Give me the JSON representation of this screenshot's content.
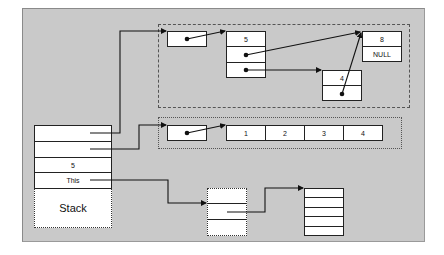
{
  "diagram": {
    "type": "memory-layout",
    "background_color": "#c9c9c9",
    "stack": {
      "label": "Stack",
      "cells": [
        "",
        "",
        "5",
        "This"
      ]
    },
    "linked_structure": {
      "pointer_node": "",
      "node_b": {
        "value": "5",
        "fields": [
          "",
          ""
        ]
      },
      "node_c": {
        "value": "8",
        "next": "NULL"
      },
      "node_d": {
        "value": "4",
        "next": ""
      }
    },
    "array": {
      "pointer_node": "",
      "values": [
        "1",
        "2",
        "3",
        "4"
      ]
    },
    "object": {
      "rows": [
        "",
        "",
        ""
      ]
    },
    "heap_block": {
      "rows": [
        "",
        "",
        "",
        "",
        ""
      ]
    }
  }
}
